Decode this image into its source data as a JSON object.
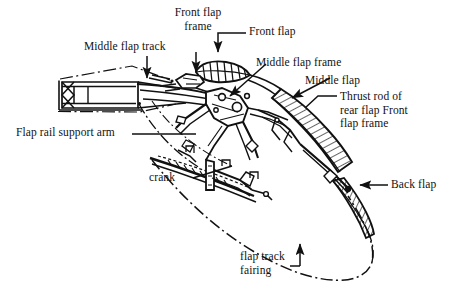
{
  "figure": {
    "type": "technical-line-drawing",
    "background_color": "#ffffff",
    "ink_color": "#111111"
  },
  "labels": {
    "front_flap_frame": "Front flap\nframe",
    "middle_flap_track": "Middle flap track",
    "front_flap": "Front flap",
    "middle_flap_frame": "Middle flap frame",
    "middle_flap": "Middle flap",
    "thrust_rod": "Thrust rod of\nrear flap Front\nflap frame",
    "flap_rail_support_arm": "Flap rail support arm",
    "crank": "crank",
    "back_flap": "Back flap",
    "flap_track_fairing": "flap track\nfairing"
  },
  "leaders": {
    "front_flap_frame": "vertical-arrow-down",
    "middle_flap_track": "vertical-arrow-down",
    "front_flap": "elbow-arrow-down",
    "middle_flap_frame": "diagonal-arrow-down-left",
    "middle_flap": "diagonal-arrow-down-left",
    "thrust_rod": "elbow-leader-left",
    "flap_rail_support_arm": "horizontal-leader-right",
    "crank": "diagonal-leader-right",
    "back_flap": "horizontal-arrow-left",
    "flap_track_fairing": "elbow-arrow-up"
  }
}
